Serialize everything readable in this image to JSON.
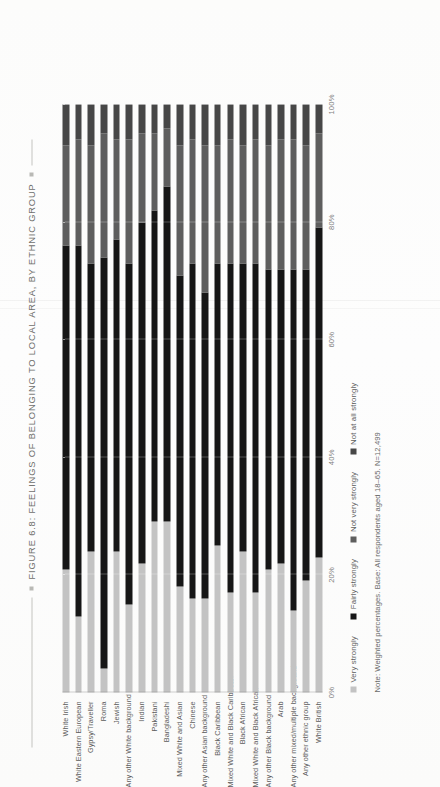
{
  "figure": {
    "title": "FIGURE 6.8: FEELINGS OF BELONGING TO LOCAL AREA, BY ETHNIC GROUP",
    "note": "Note: Weighted percentages. Base: All respondents aged 18–65. N=12,499"
  },
  "colors": {
    "very_strongly": "#c3c3c3",
    "fairly_strongly": "#161616",
    "not_very_strongly": "#5e5e5e",
    "not_at_all_strongly": "#474747",
    "text": "#5c5c5c",
    "title": "#6f6f6c"
  },
  "chart_data": {
    "type": "bar",
    "orientation": "horizontal-stacked",
    "title": "FIGURE 6.8: FEELINGS OF BELONGING TO LOCAL AREA, BY ETHNIC GROUP",
    "xlabel": "",
    "ylabel": "",
    "xlim": [
      0,
      100
    ],
    "grid": true,
    "legend_position": "bottom",
    "xticks": [
      "0%",
      "20%",
      "40%",
      "60%",
      "80%",
      "100%"
    ],
    "xtick_values": [
      0,
      20,
      40,
      60,
      80,
      100
    ],
    "categories": [
      "White Irish",
      "White Eastern European",
      "Gypsy/Traveller",
      "Roma",
      "Jewish",
      "Any other White background",
      "Indian",
      "Pakistani",
      "Bangladeshi",
      "Mixed White and Asian",
      "Chinese",
      "Any other Asian background",
      "Black Caribbean",
      "Mixed White and Black Caribbean",
      "Black African",
      "Mixed White and Black African",
      "Any other Black background",
      "Arab",
      "Any other mixed/multiple background",
      "Any other ethnic group",
      "White British"
    ],
    "series": [
      {
        "name": "Very strongly",
        "color": "#c3c3c3",
        "values": [
          21,
          13,
          24,
          4,
          24,
          15,
          22,
          29,
          29,
          18,
          16,
          16,
          25,
          17,
          24,
          17,
          21,
          22,
          14,
          19,
          23
        ]
      },
      {
        "name": "Fairly strongly",
        "color": "#161616",
        "values": [
          55,
          63,
          49,
          70,
          53,
          58,
          58,
          53,
          57,
          53,
          57,
          52,
          48,
          56,
          49,
          56,
          51,
          50,
          58,
          53,
          56
        ]
      },
      {
        "name": "Not very strongly",
        "color": "#5e5e5e",
        "values": [
          17,
          18,
          20,
          21,
          17,
          21,
          15,
          13,
          10,
          22,
          21,
          25,
          20,
          21,
          20,
          21,
          21,
          22,
          22,
          21,
          16
        ]
      },
      {
        "name": "Not at all strongly",
        "color": "#474747",
        "values": [
          7,
          6,
          7,
          5,
          6,
          6,
          5,
          5,
          4,
          7,
          6,
          7,
          7,
          6,
          7,
          6,
          7,
          6,
          6,
          7,
          5
        ]
      }
    ]
  }
}
